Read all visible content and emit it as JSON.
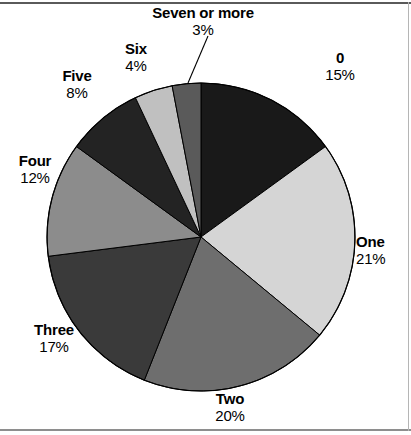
{
  "figure": {
    "background_color": "#ffffff",
    "rules": {
      "top_color": "#5a5a5a",
      "bottom_color": "#8e8e8e",
      "right_color": "#b5b5b5"
    }
  },
  "chart_data": {
    "type": "pie",
    "title": "",
    "subtitle": "",
    "xlabel": "",
    "ylabel": "",
    "legend_position": "none",
    "grid": false,
    "labels_outside": true,
    "start_angle_deg": 0,
    "direction": "clockwise",
    "units": "percent",
    "total": 100,
    "categories": [
      "0",
      "One",
      "Two",
      "Three",
      "Four",
      "Five",
      "Six",
      "Seven or more"
    ],
    "values": [
      15,
      21,
      20,
      17,
      12,
      8,
      4,
      3
    ],
    "value_labels": [
      "15%",
      "21%",
      "20%",
      "17%",
      "12%",
      "8%",
      "4%",
      "3%"
    ],
    "colors": [
      "#191919",
      "#d5d5d5",
      "#6e6e6e",
      "#3a3a3a",
      "#8c8c8c",
      "#232323",
      "#c0c0c0",
      "#5a5a5a"
    ],
    "slices": [
      {
        "label": "0",
        "value": 15,
        "value_label": "15%",
        "color": "#191919"
      },
      {
        "label": "One",
        "value": 21,
        "value_label": "21%",
        "color": "#d5d5d5"
      },
      {
        "label": "Two",
        "value": 20,
        "value_label": "20%",
        "color": "#6e6e6e"
      },
      {
        "label": "Three",
        "value": 17,
        "value_label": "17%",
        "color": "#3a3a3a"
      },
      {
        "label": "Four",
        "value": 12,
        "value_label": "12%",
        "color": "#8c8c8c"
      },
      {
        "label": "Five",
        "value": 8,
        "value_label": "8%",
        "color": "#232323"
      },
      {
        "label": "Six",
        "value": 4,
        "value_label": "4%",
        "color": "#c0c0c0"
      },
      {
        "label": "Seven or more",
        "value": 3,
        "value_label": "3%",
        "color": "#5a5a5a"
      }
    ],
    "annotations": [
      {
        "name": "leader-line-seven-or-more",
        "for": "Seven or more"
      }
    ],
    "geometry": {
      "center_x": 201,
      "center_y": 237,
      "radius": 154,
      "outline_color": "#000000"
    }
  }
}
